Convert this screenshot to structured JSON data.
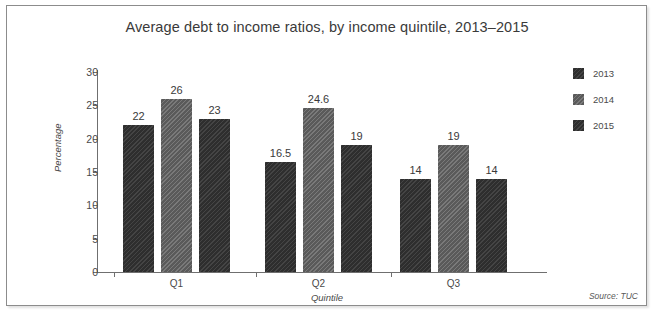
{
  "chart_data": {
    "type": "bar",
    "title": "Average debt to income ratios, by income quintile, 2013–2015",
    "subtitle": "",
    "xlabel": "Quintile",
    "ylabel": "Percentage",
    "categories": [
      "Q1",
      "Q2",
      "Q3"
    ],
    "series": [
      {
        "name": "2013",
        "values": [
          22,
          16.5,
          14
        ],
        "labels": [
          "22",
          "16.5",
          "14"
        ],
        "color": "#333333"
      },
      {
        "name": "2014",
        "values": [
          26,
          24.6,
          19
        ],
        "labels": [
          "26",
          "24.6",
          "19"
        ],
        "color": "#646464"
      },
      {
        "name": "2015",
        "values": [
          23,
          19,
          14
        ],
        "labels": [
          "23",
          "19",
          "14"
        ],
        "color": "#333333"
      }
    ],
    "ylim": [
      0,
      30
    ],
    "yticks": [
      0,
      5,
      10,
      15,
      20,
      25,
      30
    ],
    "ytick_labels": [
      "0",
      "5",
      "10",
      "15",
      "20",
      "25",
      "30"
    ],
    "grid": false,
    "legend_position": "right",
    "source": "Source: TUC"
  },
  "legend": {
    "items": [
      {
        "label": "2013",
        "swatch": "dark"
      },
      {
        "label": "2014",
        "swatch": "mid"
      },
      {
        "label": "2015",
        "swatch": "dark"
      }
    ]
  },
  "footer": {
    "source": "Source: TUC"
  }
}
